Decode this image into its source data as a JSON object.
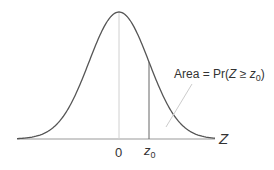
{
  "chart_data": {
    "type": "line",
    "title": "",
    "xlabel": "Z",
    "ylabel": "",
    "tick_labels": [
      "0",
      "z0"
    ],
    "annotation": "Area = Pr(Z ≥ z0)",
    "series": [
      {
        "name": "standard normal pdf",
        "mean": 0,
        "sd": 1
      }
    ],
    "markers": [
      {
        "x": 0,
        "label": "0"
      },
      {
        "x": "z0",
        "label": "z0"
      }
    ],
    "grid": false,
    "legend": false
  },
  "labels": {
    "axis_var": "Z",
    "tick_zero": "0",
    "tick_z": "z",
    "tick_z_sub": "0",
    "area_prefix": "Area = Pr(",
    "area_var": "Z",
    "area_rel": " ≥ ",
    "area_z": "z",
    "area_z_sub": "0",
    "area_suffix": ")"
  },
  "colors": {
    "curve": "#555555",
    "axis": "#888888",
    "guide": "#cccccc",
    "text": "#333333"
  }
}
